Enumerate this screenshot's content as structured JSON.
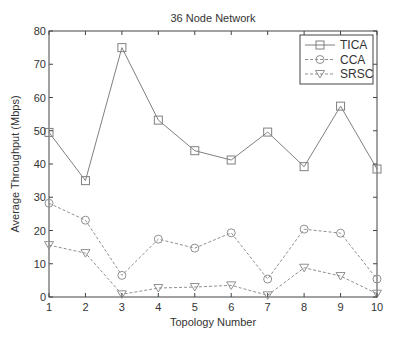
{
  "chart_data": {
    "type": "line",
    "title": "36 Node Network",
    "xlabel": "Topology Number",
    "ylabel": "Average Throughput (Mbps)",
    "x": [
      1,
      2,
      3,
      4,
      5,
      6,
      7,
      8,
      9,
      10
    ],
    "xlim": [
      1,
      10
    ],
    "ylim": [
      0,
      80
    ],
    "yticks": [
      0,
      10,
      20,
      30,
      40,
      50,
      60,
      70,
      80
    ],
    "xticks": [
      1,
      2,
      3,
      4,
      5,
      6,
      7,
      8,
      9,
      10
    ],
    "grid": false,
    "legend_position": "upper right",
    "series": [
      {
        "name": "TICA",
        "marker": "square",
        "line": "solid",
        "color": "#808080",
        "values": [
          49.5,
          35,
          75,
          53.2,
          44,
          41.2,
          49.6,
          39.2,
          57.4,
          38.5
        ]
      },
      {
        "name": "CCA",
        "marker": "circle",
        "line": "dashed",
        "color": "#909090",
        "values": [
          28.2,
          23.1,
          6.5,
          17.4,
          14.7,
          19.3,
          5.4,
          20.4,
          19.2,
          5.4
        ]
      },
      {
        "name": "SRSC",
        "marker": "triangle-down",
        "line": "dashed",
        "color": "#909090",
        "values": [
          15.6,
          13.2,
          0.8,
          2.7,
          3.0,
          3.5,
          0.5,
          8.8,
          6.3,
          1.0
        ]
      }
    ]
  }
}
